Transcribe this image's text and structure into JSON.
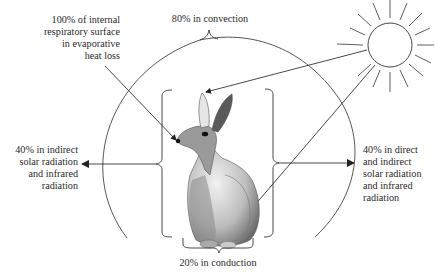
{
  "diagram": {
    "labels": {
      "evaporative": [
        "100% of internal",
        "respiratory surface",
        "in evaporative",
        "heat loss"
      ],
      "convection": "80% in convection",
      "indirect_left": [
        "40% in indirect",
        "solar radiation",
        "and infrared",
        "radiation"
      ],
      "direct_right": [
        "40% in direct",
        "and indirect",
        "solar radiation",
        "and infrared",
        "radiation"
      ],
      "conduction": "20% in conduction"
    },
    "icons": {
      "sun": "sun-icon",
      "animal": "rabbit-illustration"
    },
    "colors": {
      "line": "#333333",
      "text": "#2a2a2a",
      "background": "#ffffff"
    }
  }
}
